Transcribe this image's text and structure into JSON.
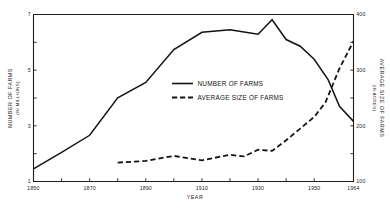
{
  "chart_data": {
    "type": "line",
    "title": "",
    "xlabel": "YEAR",
    "ylabel": "NUMBER OF FARMS",
    "ylabel_sub": "(IN MILLIONS)",
    "y2label": "AVERAGE SIZE OF FARMS",
    "y2label_sub": "(IN ACRES)",
    "grid": false,
    "legend_position": "center",
    "xlim": [
      1850,
      1964
    ],
    "ylim": [
      1,
      7
    ],
    "y2lim": [
      100,
      400
    ],
    "xticks": [
      1850,
      1860,
      1870,
      1880,
      1890,
      1900,
      1910,
      1920,
      1930,
      1940,
      1950,
      1964
    ],
    "xticklabels": [
      "1850",
      "",
      "1870",
      "",
      "1890",
      "",
      "1910",
      "",
      "1930",
      "",
      "1950",
      "1964"
    ],
    "yticks": [
      1,
      2,
      3,
      4,
      5,
      6,
      7
    ],
    "yticklabels": [
      "1",
      "",
      "3",
      "",
      "5",
      "",
      "7"
    ],
    "y2ticks": [
      100,
      150,
      200,
      250,
      300,
      350,
      400
    ],
    "y2ticklabels": [
      "100",
      "",
      "200",
      "",
      "300",
      "",
      "400"
    ],
    "series": [
      {
        "name": "NUMBER OF FARMS",
        "style": "solid",
        "axis": "left",
        "x": [
          1850,
          1860,
          1870,
          1880,
          1890,
          1900,
          1910,
          1920,
          1925,
          1930,
          1935,
          1940,
          1945,
          1950,
          1955,
          1959,
          1964
        ],
        "values": [
          1.45,
          2.05,
          2.66,
          4.01,
          4.56,
          5.74,
          6.36,
          6.45,
          6.37,
          6.29,
          6.81,
          6.1,
          5.86,
          5.39,
          4.65,
          3.7,
          3.16
        ]
      },
      {
        "name": "AVERAGE SIZE OF FARMS",
        "style": "dashed",
        "axis": "right",
        "x": [
          1880,
          1890,
          1900,
          1910,
          1920,
          1925,
          1930,
          1935,
          1940,
          1945,
          1950,
          1954,
          1959,
          1964
        ],
        "values": [
          134,
          137,
          146,
          138,
          148,
          145,
          157,
          155,
          174,
          195,
          216,
          242,
          303,
          352
        ]
      }
    ],
    "legend": [
      {
        "label": "NUMBER OF FARMS",
        "style": "solid"
      },
      {
        "label": "AVERAGE SIZE OF FARMS",
        "style": "dashed"
      }
    ],
    "colors": {
      "line": "#141414",
      "axis": "#1c1c1c",
      "background": "#ffffff"
    }
  }
}
